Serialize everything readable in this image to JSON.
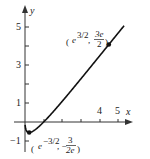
{
  "chart_data": {
    "type": "line",
    "title": "",
    "function": "x^(2/3) ln x",
    "xlabel": "x",
    "ylabel": "y",
    "xlim": [
      -0.5,
      5.5
    ],
    "ylim": [
      -1.5,
      5.5
    ],
    "x_ticks": [
      1,
      2,
      3,
      4,
      5
    ],
    "x_tick_labels": [
      "",
      "",
      "",
      "4",
      "5"
    ],
    "y_ticks": [
      -1,
      1,
      2,
      3,
      4,
      5
    ],
    "y_tick_labels": [
      "-1",
      "1",
      "",
      "3",
      "",
      "5"
    ],
    "grid": false,
    "points": [
      {
        "x": 0.2231,
        "y": -0.5518,
        "label_parts": {
          "open": "(",
          "base": "e",
          "exp": "−3/2",
          "sep": ", −",
          "num": "3",
          "den": "2e",
          "close": ")"
        }
      },
      {
        "x": 4.4817,
        "y": 4.0774,
        "label_parts": {
          "open": "(",
          "base": "e",
          "exp": "3/2",
          "sep": ", ",
          "num": "3e",
          "den": "2",
          "close": ")"
        }
      }
    ],
    "series": [
      {
        "name": "f(x)",
        "x": [
          0.01,
          0.05,
          0.1,
          0.2231,
          0.4,
          0.6,
          0.8,
          1,
          1.5,
          2,
          2.5,
          3,
          3.5,
          4,
          4.4817,
          5,
          5.3
        ],
        "values": [
          -0.2137,
          -0.4057,
          -0.496,
          -0.5518,
          -0.4975,
          -0.3611,
          -0.1923,
          0,
          0.5326,
          1.1003,
          1.6883,
          2.2857,
          2.8869,
          3.493,
          4.0774,
          4.7055,
          5.1068
        ]
      }
    ]
  },
  "labels": {
    "x_axis": "x",
    "y_axis": "y",
    "tick_4": "4",
    "tick_5": "5",
    "tick_y5": "5",
    "tick_y3": "3",
    "tick_y1": "1",
    "tick_ym1": "−1",
    "max_label": {
      "open": "(",
      "base": "e",
      "exp": "3/2",
      "sep": ", ",
      "num": "3e",
      "den": "2",
      "close": ")"
    },
    "min_label": {
      "open": "(",
      "base": "e",
      "exp": "−3/2",
      "sep": ", −",
      "num": "3",
      "den": "2e",
      "close": ")"
    }
  },
  "colors": {
    "curve": "#111111",
    "axes": "#333333"
  }
}
